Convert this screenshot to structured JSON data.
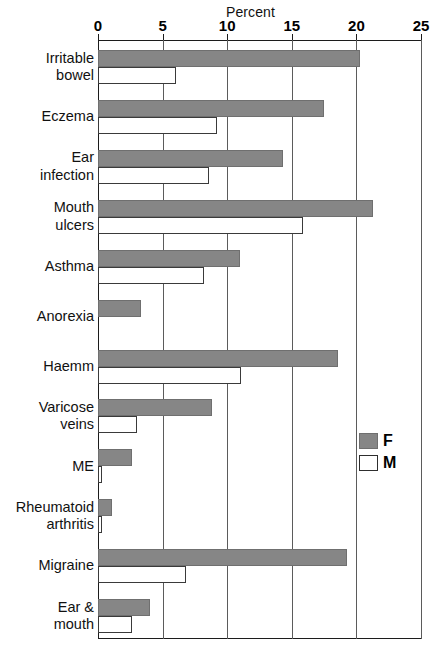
{
  "chart_data": {
    "type": "bar",
    "orientation": "horizontal",
    "title": "Percent",
    "xlabel": "Percent",
    "ylabel": "",
    "xlim": [
      0,
      25
    ],
    "xticks": [
      0,
      5,
      10,
      15,
      20,
      25
    ],
    "xtick_labels": [
      "0",
      "5",
      "10",
      "15",
      "20",
      "25"
    ],
    "grid": true,
    "legend_position": "right-middle",
    "categories": [
      "Irritable bowel",
      "Eczema",
      "Ear infection",
      "Mouth ulcers",
      "Asthma",
      "Anorexia",
      "Haemm",
      "Varicose veins",
      "ME",
      "Rheumatoid arthritis",
      "Migraine",
      "Ear & mouth"
    ],
    "category_lines": [
      [
        "Irritable",
        "bowel"
      ],
      [
        "Eczema"
      ],
      [
        "Ear",
        "infection"
      ],
      [
        "Mouth",
        "ulcers"
      ],
      [
        "Asthma"
      ],
      [
        "Anorexia"
      ],
      [
        "Haemm"
      ],
      [
        "Varicose",
        "veins"
      ],
      [
        "ME"
      ],
      [
        "Rheumatoid",
        "arthritis"
      ],
      [
        "Migraine"
      ],
      [
        "Ear &",
        "mouth"
      ]
    ],
    "series": [
      {
        "name": "F",
        "color": "#868686",
        "values": [
          20.3,
          17.5,
          14.3,
          21.3,
          11.0,
          3.3,
          18.6,
          8.8,
          2.6,
          1.1,
          19.3,
          4.0
        ]
      },
      {
        "name": "M",
        "color": "#ffffff",
        "values": [
          6.0,
          9.2,
          8.6,
          15.9,
          8.2,
          0.0,
          11.1,
          3.0,
          0.3,
          0.3,
          6.8,
          2.6
        ]
      }
    ],
    "legend": [
      {
        "label": "F",
        "swatch": "filled-gray"
      },
      {
        "label": "M",
        "swatch": "outline-white"
      }
    ],
    "colors": {
      "female_fill": "#868686",
      "male_fill": "#ffffff",
      "axis": "#1c1c1c",
      "grid": "#5b5b5b",
      "background": "#ffffff"
    }
  }
}
